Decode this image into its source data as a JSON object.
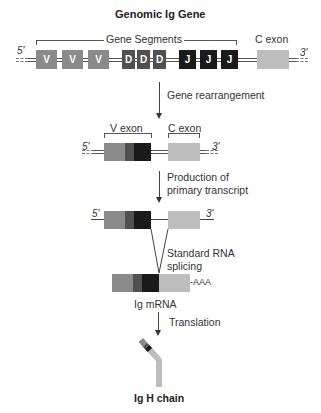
{
  "title": "Genomic Ig Gene",
  "genomic": {
    "five_prime": "5'",
    "three_prime": "3'",
    "segments_label": "Gene Segments",
    "c_exon_label": "C exon",
    "v_segments": [
      "V",
      "V",
      "V"
    ],
    "d_segments": [
      "D",
      "D",
      "D"
    ],
    "j_segments": [
      "J",
      "J",
      "J"
    ]
  },
  "steps": {
    "rearrangement": "Gene rearrangement",
    "transcription_line1": "Production of",
    "transcription_line2": "primary transcript",
    "splicing_line1": "Standard RNA",
    "splicing_line2": "splicing",
    "translation": "Translation"
  },
  "rearranged": {
    "five_prime": "5'",
    "three_prime": "3'",
    "v_exon_label": "V exon",
    "c_exon_label": "C exon"
  },
  "primary_transcript": {
    "five_prime": "5'",
    "three_prime": "3'"
  },
  "mrna": {
    "poly_a": "-AAA",
    "label": "Ig mRNA"
  },
  "protein": {
    "label": "Ig H chain"
  },
  "colors": {
    "v": "#8a8a8a",
    "d": "#505050",
    "j": "#1a1a1a",
    "c": "#bdbdbd"
  }
}
